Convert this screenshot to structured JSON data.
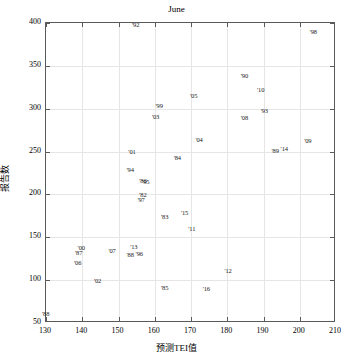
{
  "chart_data": {
    "type": "scatter",
    "title": "June",
    "xlabel": "预测TEI值",
    "ylabel": "报告数",
    "xlim": [
      130,
      210
    ],
    "ylim": [
      50,
      400
    ],
    "xticks": [
      130,
      140,
      150,
      160,
      170,
      180,
      190,
      200,
      210
    ],
    "yticks": [
      50,
      100,
      150,
      200,
      250,
      300,
      350,
      400
    ],
    "grid": true,
    "legend": "none",
    "marker_style": "text-label",
    "points": [
      {
        "label": "'92",
        "x": 155.0,
        "y": 398
      },
      {
        "label": "'98",
        "x": 204.0,
        "y": 389
      },
      {
        "label": "'90",
        "x": 185.0,
        "y": 338
      },
      {
        "label": "'10",
        "x": 189.5,
        "y": 322
      },
      {
        "label": "'05",
        "x": 171.0,
        "y": 315
      },
      {
        "label": "'99",
        "x": 161.5,
        "y": 303
      },
      {
        "label": "'93",
        "x": 190.5,
        "y": 297
      },
      {
        "label": "'03",
        "x": 160.5,
        "y": 290
      },
      {
        "label": "'08",
        "x": 185.0,
        "y": 289
      },
      {
        "label": "'04",
        "x": 172.5,
        "y": 263
      },
      {
        "label": "'09",
        "x": 202.5,
        "y": 262
      },
      {
        "label": "'14",
        "x": 196.0,
        "y": 253
      },
      {
        "label": "'89",
        "x": 193.5,
        "y": 251
      },
      {
        "label": "'01",
        "x": 154.0,
        "y": 250
      },
      {
        "label": "'84",
        "x": 166.5,
        "y": 243
      },
      {
        "label": "'94",
        "x": 153.5,
        "y": 228
      },
      {
        "label": "'86",
        "x": 157.0,
        "y": 216
      },
      {
        "label": "'95",
        "x": 157.8,
        "y": 215
      },
      {
        "label": "'82",
        "x": 157.0,
        "y": 199
      },
      {
        "label": "'97",
        "x": 156.5,
        "y": 194
      },
      {
        "label": "'15",
        "x": 168.5,
        "y": 178
      },
      {
        "label": "'83",
        "x": 163.0,
        "y": 174
      },
      {
        "label": "'11",
        "x": 170.5,
        "y": 160
      },
      {
        "label": "'13",
        "x": 154.5,
        "y": 139
      },
      {
        "label": "'00",
        "x": 140.0,
        "y": 137
      },
      {
        "label": "'07",
        "x": 148.5,
        "y": 134
      },
      {
        "label": "'87",
        "x": 139.3,
        "y": 132
      },
      {
        "label": "'96",
        "x": 156.0,
        "y": 130
      },
      {
        "label": "'88",
        "x": 153.5,
        "y": 129
      },
      {
        "label": "'06",
        "x": 139.0,
        "y": 120
      },
      {
        "label": "'12",
        "x": 180.5,
        "y": 111
      },
      {
        "label": "'02",
        "x": 144.5,
        "y": 99
      },
      {
        "label": "'85",
        "x": 163.0,
        "y": 91
      },
      {
        "label": "'16",
        "x": 174.5,
        "y": 90
      },
      {
        "label": "'88b",
        "x": 130.2,
        "y": 60
      }
    ]
  }
}
